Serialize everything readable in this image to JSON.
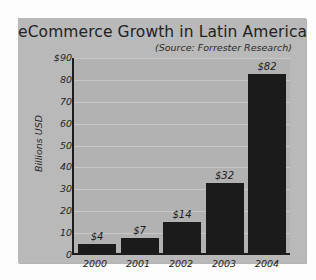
{
  "chart_data": {
    "type": "bar",
    "title": "eCommerce Growth in Latin America",
    "subtitle": "(Source: Forrester Research)",
    "categories": [
      "2000",
      "2001",
      "2002",
      "2003",
      "2004"
    ],
    "values": [
      4,
      7,
      14,
      32,
      82
    ],
    "value_labels": [
      "$4",
      "$7",
      "$14",
      "$32",
      "$82"
    ],
    "xlabel": "",
    "ylabel": "Billions USD",
    "ylim": [
      0,
      90
    ],
    "ytick_labels": [
      "$90",
      "80",
      "70",
      "60",
      "50",
      "40",
      "30",
      "20",
      "10",
      "0"
    ],
    "ytick_values": [
      90,
      80,
      70,
      60,
      50,
      40,
      30,
      20,
      10,
      0
    ],
    "grid": true,
    "legend": "none",
    "colors": {
      "bar": "#1b1b1b",
      "plot_background": "#b2b2b2",
      "card_background": "#b9b9b9",
      "gridline": "#c7c7c7",
      "axis": "#1c1c1c",
      "text": "#232323",
      "page_background": "#fdfdfd"
    }
  }
}
